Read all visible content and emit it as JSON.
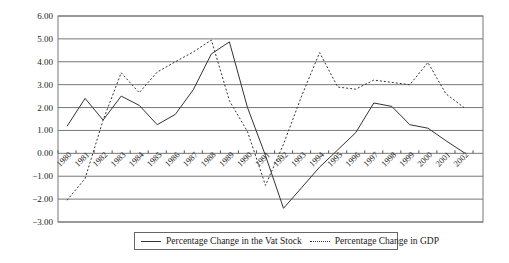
{
  "chart_data": {
    "type": "line",
    "title": "",
    "xlabel": "",
    "ylabel": "",
    "ylim": [
      -3.0,
      6.0
    ],
    "yticks": [
      "6.00",
      "5.00",
      "4.00",
      "3.00",
      "2.00",
      "1.00",
      "0.00",
      "-1.00",
      "-2.00",
      "-3.00"
    ],
    "grid": true,
    "legend_position": "bottom",
    "categories": [
      "1980",
      "1981",
      "1982",
      "1983",
      "1984",
      "1985",
      "1986",
      "1987",
      "1988",
      "1989",
      "1990",
      "1991",
      "1992",
      "1993",
      "1994",
      "1995",
      "1996",
      "1997",
      "1998",
      "1999",
      "2000",
      "2001",
      "2002"
    ],
    "series": [
      {
        "name": "Percentage Change in the Vat Stock",
        "style": "solid",
        "values": [
          1.18,
          2.4,
          1.45,
          2.5,
          2.1,
          1.25,
          1.7,
          2.78,
          4.35,
          4.87,
          2.0,
          -0.1,
          -2.4,
          -1.5,
          -0.6,
          0.15,
          0.9,
          2.2,
          2.05,
          1.25,
          1.1,
          0.55,
          0.03
        ]
      },
      {
        "name": "Percentage Change in GDP",
        "style": "dotted",
        "values": [
          -2.05,
          -1.1,
          1.45,
          3.52,
          2.65,
          3.55,
          4.0,
          4.43,
          4.95,
          2.3,
          0.95,
          -1.4,
          0.4,
          2.5,
          4.4,
          2.9,
          2.8,
          3.2,
          3.1,
          3.0,
          3.97,
          2.6,
          2.0
        ]
      }
    ]
  },
  "legend": {
    "items": [
      {
        "label": "Percentage Change in the Vat Stock",
        "style": "solid"
      },
      {
        "label": "Percentage Change in GDP",
        "style": "dotted"
      }
    ]
  }
}
